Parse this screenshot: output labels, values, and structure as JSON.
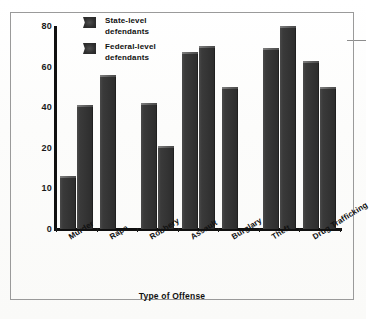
{
  "figure": {
    "y_axis_title": "Percentage of Defendants Released",
    "x_axis_title": "Type of Offense"
  },
  "legend": {
    "items": [
      {
        "label_line1": "State-level",
        "label_line2": "defendants",
        "swatch": "dark-square-swatch"
      },
      {
        "label_line1": "Federal-level",
        "label_line2": "defendants",
        "swatch": "dark-square-swatch"
      }
    ]
  },
  "chart_data": {
    "type": "bar",
    "title": "",
    "xlabel": "Type of Offense",
    "ylabel": "Percentage of Defendants Released",
    "categories": [
      "Murder",
      "Rape",
      "Robbery",
      "Assault",
      "Burglary",
      "Theft",
      "Drug Trafficking"
    ],
    "series": [
      {
        "name": "State-level defendants",
        "values": [
          13,
          56,
          42,
          67,
          50,
          69,
          63
        ]
      },
      {
        "name": "Federal-level defendants",
        "values": [
          41,
          null,
          21,
          70,
          null,
          80,
          50
        ]
      }
    ],
    "ytick_labels": [
      "80",
      "60",
      "40",
      "20",
      "10",
      "0"
    ],
    "ytick_values": [
      80,
      60,
      40,
      20,
      10,
      0
    ],
    "ylim": [
      0,
      80
    ],
    "grid": false,
    "legend_position": "top-left-inside"
  },
  "colors": {
    "bar_fill": "#343434",
    "axis": "#101010",
    "frame": "#9a9a9a",
    "text": "#111111",
    "background": "#fdfdfd"
  }
}
